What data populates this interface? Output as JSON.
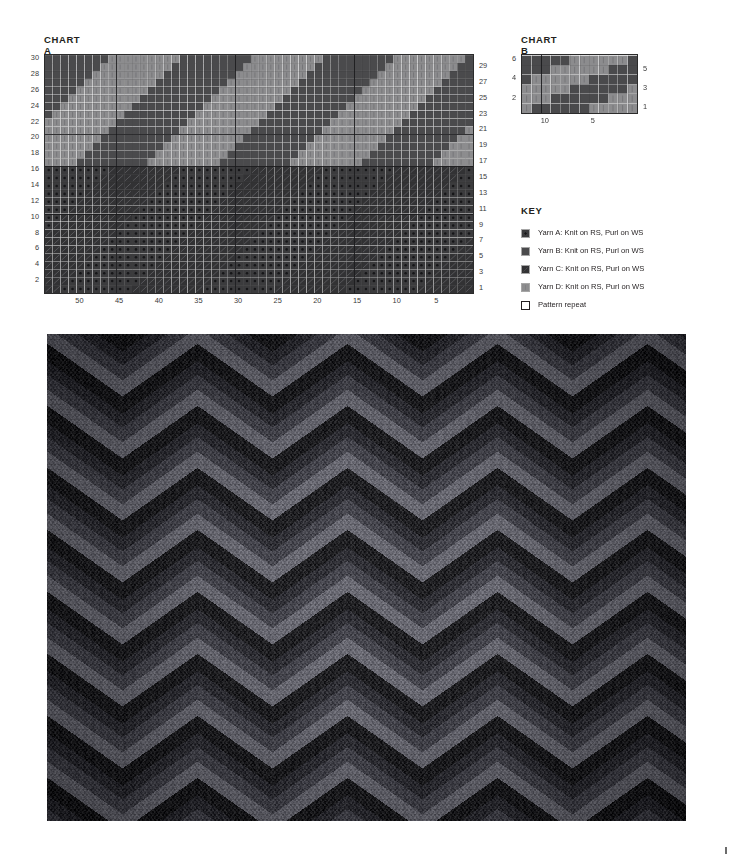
{
  "page": {
    "background": "#ffffff",
    "corner_mark": "registration-tick"
  },
  "chart_a": {
    "title": "CHART A",
    "stitches": 54,
    "rows": 30,
    "left_row_labels": [
      30,
      28,
      26,
      24,
      22,
      20,
      18,
      16,
      14,
      12,
      10,
      8,
      6,
      4,
      2
    ],
    "right_row_labels": [
      29,
      27,
      25,
      23,
      21,
      19,
      17,
      15,
      13,
      11,
      9,
      7,
      5,
      3,
      1
    ],
    "bottom_stitch_labels": [
      50,
      45,
      40,
      35,
      30,
      25,
      20,
      15,
      10,
      5
    ],
    "repeat_box": {
      "from_stitch": 54,
      "to_stitch": 1,
      "from_row": 1,
      "to_row": 30
    }
  },
  "chart_b": {
    "title": "CHART B",
    "stitches": 12,
    "rows": 6,
    "left_row_labels": [
      6,
      4,
      2
    ],
    "right_row_labels": [
      5,
      3,
      1
    ],
    "bottom_stitch_labels": [
      10,
      5
    ]
  },
  "key": {
    "title": "KEY",
    "items": [
      {
        "name": "yarn-a",
        "label": "Yarn A: Knit on RS, Purl on WS",
        "color": "#3b3b3d",
        "texture": "dots"
      },
      {
        "name": "yarn-b",
        "label": "Yarn B: Knit on RS, Purl on WS",
        "color": "#4a4a4c",
        "texture": "solid"
      },
      {
        "name": "yarn-c",
        "label": "Yarn C: Knit on RS, Purl on WS",
        "color": "#323234",
        "texture": "hatch"
      },
      {
        "name": "yarn-d",
        "label": "Yarn D: Knit on RS, Purl on WS",
        "color": "#8c8c8e",
        "texture": "vlines"
      },
      {
        "name": "pattern-repeat",
        "label": "Pattern repeat",
        "color": "#ffffff",
        "texture": "outline"
      }
    ]
  },
  "colors": {
    "yarn_a": "#3b3b3d",
    "yarn_b": "#4a4a4c",
    "yarn_c": "#323234",
    "yarn_d": "#8c8c8e",
    "grid_line": "#2b2b2b",
    "cell_line": "#6e6e70",
    "text": "#231f20"
  },
  "chart_data": {
    "type": "heatmap",
    "xlabel": "",
    "ylabel": "",
    "charts": [
      {
        "name": "CHART A",
        "stitches": 54,
        "rows": 30,
        "description": "Top half rows 17-30 alternate Yarn D and Yarn B in stepped diagonal bands; bottom half rows 1-16 alternate Yarn A and Yarn C in stepped diagonal bands.",
        "legend": [
          "Yarn A",
          "Yarn B",
          "Yarn C",
          "Yarn D"
        ]
      },
      {
        "name": "CHART B",
        "stitches": 12,
        "rows": 6,
        "description": "Stepped diagonal of Yarn D against Yarn B over 12 stitches and 6 rows.",
        "legend": [
          "Yarn B",
          "Yarn D"
        ]
      }
    ]
  },
  "photo": {
    "alt": "knitted-swatch-chevron-colourwork",
    "description": "Knitted fabric swatch showing chevron zigzag colourwork in greys"
  }
}
